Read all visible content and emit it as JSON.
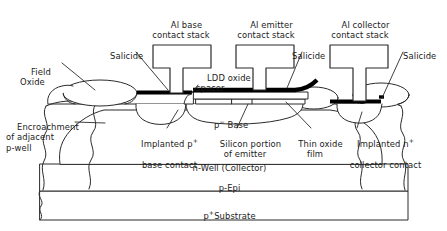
{
  "figure": {
    "type": "semiconductor-cross-section",
    "colors": {
      "outline": "#2b2b2b",
      "salicide": "#000000",
      "background": "#ffffff",
      "text": "#1a1a1a"
    }
  },
  "callouts": {
    "al_base_stack": "Al base\ncontact stack",
    "al_emitter_stack": "Al emitter\ncontact stack",
    "al_collector_stack": "Al collector\ncontact stack",
    "salicide_left": "Salicide",
    "salicide_mid": "Salicide",
    "salicide_right": "Salicide",
    "field_oxide": "Field\nOxide",
    "ldd_oxide_spacer": "LDD oxide\nspacer",
    "encroachment": "Encroachment\nof adjacent\np-well",
    "implanted_base_contact_line1": "Implanted p",
    "implanted_base_contact_sup": "+",
    "implanted_base_contact_line2": "base contact",
    "silicon_portion_emitter": "Silicon portion\nof emitter",
    "thin_oxide_film": "Thin oxide\nfilm",
    "implanted_collector_contact_line1": "Implanted n",
    "implanted_collector_contact_sup": "+",
    "implanted_collector_contact_line2": "collector contact"
  },
  "regions": {
    "p_base_text": "p",
    "p_base_sup": "−",
    "p_base_name": " Base",
    "n_well": "n-Well (Collector)",
    "p_epi": "p-Epi",
    "p_substrate_text": "p",
    "p_substrate_sup": "+",
    "p_substrate_name": "Substrate"
  }
}
